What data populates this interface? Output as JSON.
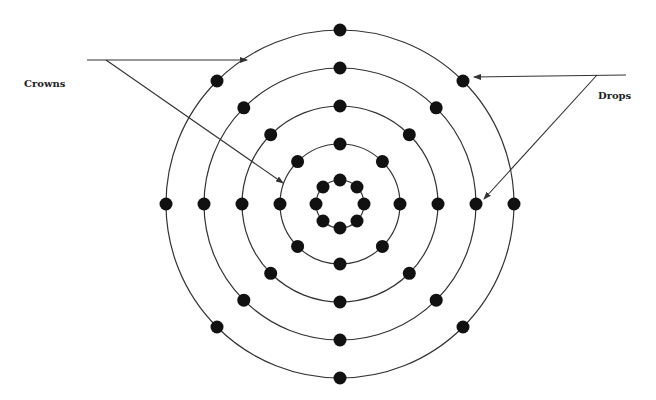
{
  "labels": {
    "crowns": "Crowns",
    "drops": "Drops"
  },
  "colors": {
    "stroke": "#333333",
    "dot": "#111111",
    "background": "#ffffff"
  },
  "diagram": {
    "type": "concentric-rings",
    "center": [
      340,
      204
    ],
    "rings": [
      {
        "radius": 24,
        "dots": 8
      },
      {
        "radius": 60,
        "dots": 8
      },
      {
        "radius": 98,
        "dots": 8
      },
      {
        "radius": 136,
        "dots": 8
      },
      {
        "radius": 174,
        "dots": 8
      }
    ],
    "dot_radius": 6.5,
    "callouts": [
      {
        "label": "Crowns",
        "arrows": [
          {
            "from": [
              87,
              60
            ],
            "to": [
              247,
              60
            ],
            "target": "outer ring"
          },
          {
            "from": [
              106,
              60
            ],
            "to": [
              283,
              183
            ],
            "target": "ring 2"
          }
        ]
      },
      {
        "label": "Drops",
        "arrows": [
          {
            "from": [
              626,
              75
            ],
            "to": [
              474,
              77
            ],
            "target": "outer ring dot"
          },
          {
            "from": [
              597,
              75
            ],
            "to": [
              484,
              199
            ],
            "target": "ring 4 dot"
          }
        ]
      }
    ]
  }
}
